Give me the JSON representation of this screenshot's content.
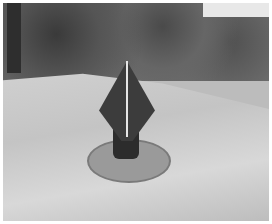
{
  "image": {
    "description": "Grayscale photo of a dark conical/diamond-shaped marker on a round base plate standing on rocky ground with shrubs behind",
    "colors": {
      "dark_object": "#3c3c3c",
      "rock": "#c8c8c8",
      "foliage": "#5a5a5a"
    }
  }
}
